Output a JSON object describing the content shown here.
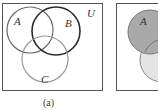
{
  "figure_a": {
    "caption": "(a)",
    "universe_label": "U",
    "sets": [
      {
        "label": "A",
        "cx": 30,
        "cy": 30,
        "r": 23,
        "stroke": "#6a6a6a",
        "fill": "none"
      },
      {
        "label": "B",
        "cx": 56,
        "cy": 31,
        "r": 24,
        "stroke": "#2a2a2a",
        "fill": "none"
      },
      {
        "label": "C",
        "cx": 45,
        "cy": 59,
        "r": 23,
        "stroke": "#9a9a9a",
        "fill": "none"
      }
    ]
  },
  "figure_b": {
    "sets": [
      {
        "label": "A",
        "cx": 150,
        "cy": 32,
        "r": 22,
        "fill": "#a9a9a9",
        "stroke": "#777777"
      },
      {
        "label": "",
        "cx": 162,
        "cy": 60,
        "r": 22,
        "fill": "#e4e4e4",
        "stroke": "#888888"
      }
    ]
  }
}
